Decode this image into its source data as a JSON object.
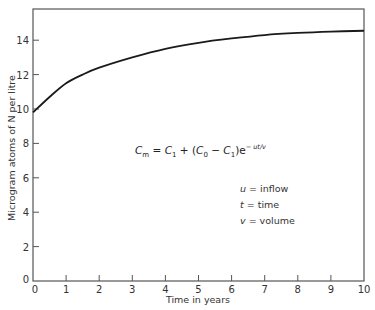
{
  "chart_data": {
    "type": "line",
    "title": "",
    "xlabel": "Time in years",
    "ylabel": "Microgram atoms of N per litre",
    "xlim": [
      0,
      10
    ],
    "ylim": [
      0,
      15.5
    ],
    "xticks": [
      0,
      1,
      2,
      3,
      4,
      5,
      6,
      7,
      8,
      9,
      10
    ],
    "yticks": [
      0,
      2,
      4,
      6,
      8,
      10,
      12,
      14
    ],
    "grid": false,
    "series": [
      {
        "name": "C_m",
        "x": [
          0,
          0.5,
          1,
          1.5,
          2,
          3,
          4,
          5,
          6,
          7,
          8,
          9,
          10
        ],
        "values": [
          9.8,
          10.7,
          11.5,
          12.0,
          12.4,
          13.0,
          13.5,
          13.85,
          14.1,
          14.3,
          14.42,
          14.5,
          14.55
        ]
      }
    ],
    "annotations": [
      "C_m = C_1 + (C_0 - C_1) e^(-ut/v)",
      "u = inflow",
      "t = time",
      "v = volume"
    ]
  },
  "equation": {
    "lhs": "C",
    "lhs_sub": "m",
    "eq": " = ",
    "c1": "C",
    "c1_sub": "1",
    "plus": " + (",
    "c0": "C",
    "c0_sub": "0",
    "minus": " − ",
    "c1b": "C",
    "c1b_sub": "1",
    "close": ")e",
    "exp": "− ut/v"
  },
  "legend": [
    {
      "symbol": "u",
      "text": " = inflow"
    },
    {
      "symbol": "t",
      "text": " = time"
    },
    {
      "symbol": "v",
      "text": " = volume"
    }
  ],
  "axis": {
    "x_title": "Time in years",
    "y_title": "Microgram atoms of N per litre",
    "x_tick_labels": [
      "0",
      "1",
      "2",
      "3",
      "4",
      "5",
      "6",
      "7",
      "8",
      "9",
      "10"
    ],
    "y_tick_labels": [
      "0",
      "2",
      "4",
      "6",
      "8",
      "10",
      "12",
      "14"
    ]
  }
}
